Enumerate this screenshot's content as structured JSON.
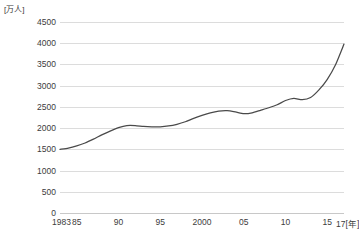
{
  "chart_data": {
    "type": "line",
    "title": "",
    "subtitle": "",
    "xlabel": "[年]",
    "ylabel": "[万人]",
    "unit_label": "[万人]",
    "year_unit_label": "17[年]",
    "ylim": [
      0,
      4500
    ],
    "xlim": [
      1983,
      2017
    ],
    "grid": true,
    "legend": null,
    "yticks": [
      "4500",
      "4000",
      "3500",
      "3000",
      "2500",
      "2000",
      "1500",
      "1000",
      "500",
      "0"
    ],
    "ytick_values": [
      4500,
      4000,
      3500,
      3000,
      2500,
      2000,
      1500,
      1000,
      500,
      0
    ],
    "xticks": [
      "1983",
      "85",
      "90",
      "95",
      "2000",
      "05",
      "10",
      "15",
      "17[年]"
    ],
    "xtick_values": [
      1983,
      1985,
      1990,
      1995,
      2000,
      2005,
      2010,
      2015,
      2017
    ],
    "series": [
      {
        "name": "",
        "color": "#4a4a4a",
        "x": [
          1983,
          1984,
          1985,
          1986,
          1987,
          1988,
          1989,
          1990,
          1991,
          1992,
          1993,
          1994,
          1995,
          1996,
          1997,
          1998,
          1999,
          2000,
          2001,
          2002,
          2003,
          2004,
          2005,
          2006,
          2007,
          2008,
          2009,
          2010,
          2011,
          2012,
          2013,
          2014,
          2015,
          2016,
          2017
        ],
        "values": [
          1500,
          1530,
          1580,
          1650,
          1740,
          1840,
          1930,
          2010,
          2060,
          2060,
          2040,
          2030,
          2030,
          2050,
          2090,
          2150,
          2230,
          2300,
          2360,
          2400,
          2410,
          2380,
          2340,
          2360,
          2420,
          2480,
          2550,
          2650,
          2700,
          2670,
          2720,
          2900,
          3150,
          3500,
          3980
        ]
      }
    ]
  }
}
